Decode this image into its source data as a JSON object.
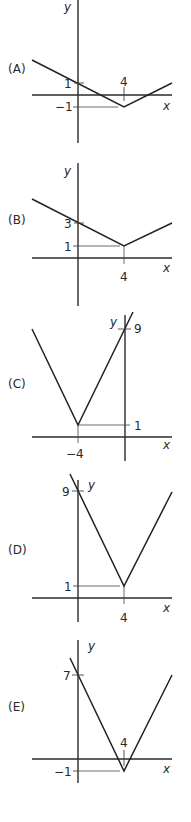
{
  "options": [
    {
      "label": "(A)",
      "axis_x_label": "x",
      "axis_y_label": "y",
      "vertex": [
        4,
        -1
      ],
      "y_intercept": 1,
      "annotations": {
        "x_tick": "4",
        "y_tick_upper": "1",
        "y_tick_vertex": "−1"
      }
    },
    {
      "label": "(B)",
      "axis_x_label": "x",
      "axis_y_label": "y",
      "vertex": [
        4,
        1
      ],
      "y_intercept": 3,
      "annotations": {
        "x_tick": "4",
        "y_tick_upper": "3",
        "y_tick_vertex": "1"
      }
    },
    {
      "label": "(C)",
      "axis_x_label": "x",
      "axis_y_label": "y",
      "vertex": [
        -4,
        1
      ],
      "y_intercept": 9,
      "annotations": {
        "x_tick": "−4",
        "y_tick_upper": "9",
        "y_tick_vertex": "1"
      }
    },
    {
      "label": "(D)",
      "axis_x_label": "x",
      "axis_y_label": "y",
      "vertex": [
        4,
        1
      ],
      "y_intercept": 9,
      "annotations": {
        "x_tick": "4",
        "y_tick_upper": "9",
        "y_tick_vertex": "1"
      }
    },
    {
      "label": "(E)",
      "axis_x_label": "x",
      "axis_y_label": "y",
      "vertex": [
        4,
        -1
      ],
      "y_intercept": 7,
      "annotations": {
        "x_tick": "4",
        "y_tick_upper": "7",
        "y_tick_vertex": "−1"
      }
    }
  ]
}
